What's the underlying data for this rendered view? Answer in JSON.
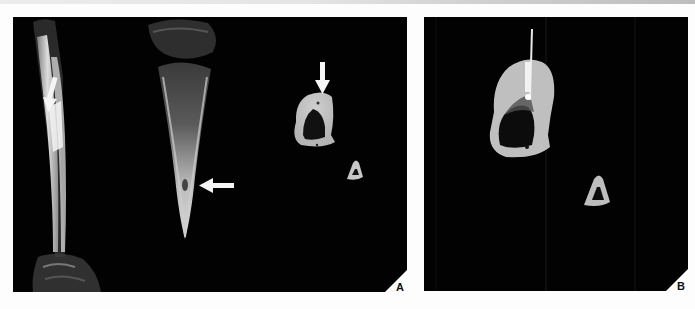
{
  "figure": {
    "panels": [
      {
        "id": "A",
        "label": "A",
        "description": "MR images: coronal long-axis views of the lower-leg bones with arrows marking lesions, plus an axial cross-section with an arrow at the cortex",
        "annotations": [
          {
            "type": "arrow",
            "direction": "down",
            "target": "left long bone lesion"
          },
          {
            "type": "arrow",
            "direction": "left",
            "target": "distal tibia lesion"
          },
          {
            "type": "arrow",
            "direction": "down",
            "target": "axial cross-section cortex"
          }
        ]
      },
      {
        "id": "B",
        "label": "B",
        "description": "Axial CT image showing a needle inserted into the bone cross-section",
        "annotations": [
          {
            "type": "needle",
            "target": "bone lesion"
          }
        ]
      }
    ],
    "colors": {
      "panel_background": "#020202",
      "page_background": "#fdfdfd",
      "bone_bright": "#e8e8e8",
      "bone_mid": "#bdbdbd",
      "arrow": "#f5f5f5",
      "label_text": "#111111"
    }
  }
}
